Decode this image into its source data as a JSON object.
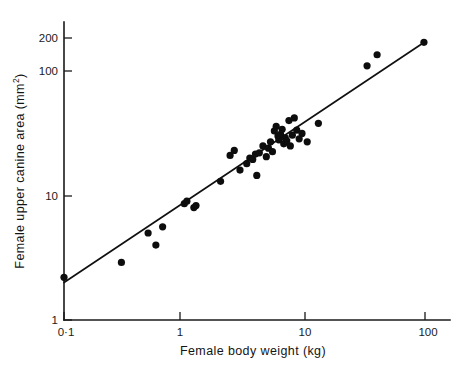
{
  "chart_data": {
    "type": "scatter",
    "title": "",
    "xlabel": "Female body weight (kg)",
    "ylabel_main": "Female upper canine area (mm",
    "ylabel_exponent": "2",
    "ylabel_close": ")",
    "ylabel_full": "Female upper canine area (mm2)",
    "xscale": "log",
    "yscale": "log",
    "xlim": [
      0.1,
      100
    ],
    "ylim": [
      1,
      260
    ],
    "grid": false,
    "legend": null,
    "x_tick_labels": [
      "0·1",
      "1",
      "10",
      "100"
    ],
    "x_tick_values": [
      0.1,
      1,
      10,
      100
    ],
    "y_tick_labels": [
      "1",
      "10",
      "100",
      "200"
    ],
    "y_tick_values": [
      1,
      10,
      100,
      200
    ],
    "series": [
      {
        "name": "Primate species",
        "marker": "filled-circle",
        "color": "#0d0d0d",
        "points": [
          [
            0.1,
            2.2
          ],
          [
            0.3,
            2.9
          ],
          [
            0.5,
            5.0
          ],
          [
            0.58,
            4.0
          ],
          [
            0.66,
            5.6
          ],
          [
            1.0,
            8.6
          ],
          [
            1.05,
            9.0
          ],
          [
            1.2,
            8.0
          ],
          [
            1.25,
            8.3
          ],
          [
            2.0,
            13.0
          ],
          [
            2.4,
            21.0
          ],
          [
            2.6,
            23.0
          ],
          [
            2.9,
            16.0
          ],
          [
            3.3,
            18.0
          ],
          [
            3.5,
            20.0
          ],
          [
            3.7,
            19.5
          ],
          [
            3.9,
            21.5
          ],
          [
            4.0,
            14.5
          ],
          [
            4.2,
            22.0
          ],
          [
            4.5,
            25.0
          ],
          [
            4.8,
            20.5
          ],
          [
            5.0,
            24.0
          ],
          [
            5.2,
            27.0
          ],
          [
            5.4,
            22.5
          ],
          [
            5.6,
            33.0
          ],
          [
            5.8,
            36.0
          ],
          [
            6.0,
            30.0
          ],
          [
            6.1,
            28.0
          ],
          [
            6.3,
            31.0
          ],
          [
            6.5,
            34.0
          ],
          [
            6.7,
            26.0
          ],
          [
            6.9,
            29.0
          ],
          [
            7.1,
            27.5
          ],
          [
            7.4,
            40.0
          ],
          [
            7.6,
            25.0
          ],
          [
            7.9,
            30.5
          ],
          [
            8.2,
            42.0
          ],
          [
            8.6,
            33.5
          ],
          [
            9.0,
            28.5
          ],
          [
            9.5,
            31.5
          ],
          [
            10.5,
            27.0
          ],
          [
            13.0,
            38.0
          ],
          [
            33.0,
            110.0
          ],
          [
            40.0,
            135.0
          ],
          [
            98.0,
            170.0
          ]
        ]
      }
    ],
    "fitted_line": {
      "name": "Least-squares regression",
      "x_start": 0.1,
      "y_start": 2.0,
      "x_end": 100.0,
      "y_end": 172.0
    },
    "annotations": []
  },
  "figure": {
    "background_color": "#ffffff",
    "ink_color": "#0d0d0d"
  }
}
